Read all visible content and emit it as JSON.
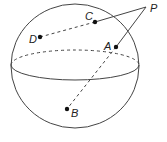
{
  "diagram": {
    "type": "sphere-geometry",
    "colors": {
      "stroke": "#444444",
      "point": "#111111",
      "label": "#222222",
      "background": "#ffffff"
    },
    "sphere": {
      "cx": 75,
      "cy": 66,
      "rx": 64,
      "ry": 62
    },
    "equator": {
      "cx": 75,
      "cy": 65,
      "rx": 64,
      "ry": 15,
      "back": "dashed",
      "front": "solid"
    },
    "points": [
      {
        "id": "P",
        "label": "P",
        "x": 146,
        "y": 7,
        "outside": true
      },
      {
        "id": "C",
        "label": "C",
        "x": 95,
        "y": 22
      },
      {
        "id": "D",
        "label": "D",
        "x": 40,
        "y": 37
      },
      {
        "id": "A",
        "label": "A",
        "x": 116,
        "y": 47
      },
      {
        "id": "B",
        "label": "B",
        "x": 67,
        "y": 109
      }
    ],
    "segments": [
      {
        "from": "P",
        "to": "C",
        "style": "solid"
      },
      {
        "from": "P",
        "to": "A",
        "style": "solid"
      },
      {
        "from": "C",
        "to": "D",
        "style": "dashed"
      },
      {
        "from": "A",
        "to": "B",
        "style": "dashed"
      }
    ]
  }
}
